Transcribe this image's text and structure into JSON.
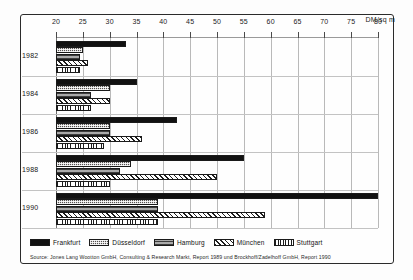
{
  "chart_data": {
    "type": "bar",
    "orientation": "horizontal",
    "title": "",
    "xlabel": "DM/sq m",
    "ylabel": "",
    "unit_label": "DM/sq m",
    "xlim": [
      20,
      80
    ],
    "xticks": [
      20,
      25,
      30,
      35,
      40,
      45,
      50,
      55,
      60,
      65,
      70,
      75,
      80
    ],
    "grid": true,
    "legend_position": "bottom",
    "categories": [
      "1982",
      "1984",
      "1986",
      "1988",
      "1990"
    ],
    "series": [
      {
        "name": "Frankfurt",
        "pattern": "solid-black",
        "values": [
          33.0,
          35.0,
          42.5,
          55.0,
          80.0
        ]
      },
      {
        "name": "Düsseldorf",
        "pattern": "dark-dotted",
        "values": [
          25.0,
          30.0,
          30.0,
          34.0,
          39.0
        ]
      },
      {
        "name": "Hamburg",
        "pattern": "grey-horizontal",
        "values": [
          24.5,
          26.5,
          30.0,
          32.0,
          39.0
        ]
      },
      {
        "name": "München",
        "pattern": "diagonal-hatch",
        "values": [
          26.0,
          30.0,
          36.0,
          50.0,
          59.0
        ]
      },
      {
        "name": "Stuttgart",
        "pattern": "vertical-lines",
        "values": [
          24.5,
          26.5,
          29.0,
          30.0,
          39.0
        ]
      }
    ],
    "source": "Source: Jones Lang Wootton GmbH, Consulting & Research Markt, Report 1989 und Brockhoff/Zadelhoff GmbH, Report 1990"
  },
  "colors": {
    "frankfurt": "#111111",
    "dusseldorf": "#55514f",
    "hamburg": "#7c7c7c",
    "munchen": "#ffffff",
    "stuttgart": "#ffffff",
    "frame": "#2b2b2b",
    "grid": "#b9b9b9",
    "text": "#111111"
  }
}
